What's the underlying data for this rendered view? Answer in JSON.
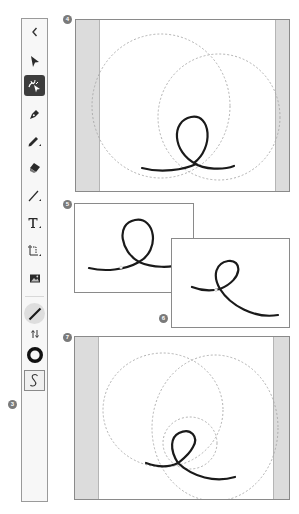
{
  "toolbar": {
    "items": [
      {
        "name": "collapse",
        "icon": "chevron-left-icon",
        "glyph": "‹"
      },
      {
        "name": "selection",
        "icon": "arrow-pointer-icon"
      },
      {
        "name": "shaper",
        "icon": "shaper-icon",
        "active": true
      },
      {
        "name": "pen",
        "icon": "pen-icon"
      },
      {
        "name": "pencil",
        "icon": "pencil-icon"
      },
      {
        "name": "eraser",
        "icon": "eraser-icon"
      },
      {
        "name": "line",
        "icon": "line-icon"
      },
      {
        "name": "type",
        "icon": "type-icon",
        "glyph": "T"
      },
      {
        "name": "transform",
        "icon": "transform-icon"
      },
      {
        "name": "image",
        "icon": "image-icon"
      },
      {
        "name": "stroke-color",
        "icon": "stroke-swatch-icon"
      },
      {
        "name": "swap",
        "icon": "swap-arrows-icon",
        "glyph": "⇅"
      },
      {
        "name": "fill-color",
        "icon": "fill-ring-icon"
      },
      {
        "name": "curvature",
        "icon": "curve-s-icon",
        "glyph": "S",
        "selected": true
      }
    ]
  },
  "callouts": {
    "c3": "3",
    "c4": "4",
    "c5": "5",
    "c6": "6",
    "c7": "7"
  },
  "colors": {
    "toolbar_bg": "#f7f7f7",
    "active_tool_bg": "#3d3d3d",
    "panel_border": "#8a8a8a",
    "pasteboard_band": "#dcdcdc",
    "guide_dashed": "#a8a8a8",
    "stroke": "#1a1a1a",
    "badge_bg": "#7a7a7a"
  },
  "panels": [
    {
      "id": "4",
      "description": "Two overlapping dashed circle guides with a looped stroke at the bottom"
    },
    {
      "id": "5",
      "description": "Looped stroke with symmetric tails"
    },
    {
      "id": "6",
      "description": "Tilted looped stroke with a long right tail"
    },
    {
      "id": "7",
      "description": "Three dashed circle guides with a smaller distorted loop stroke"
    }
  ]
}
